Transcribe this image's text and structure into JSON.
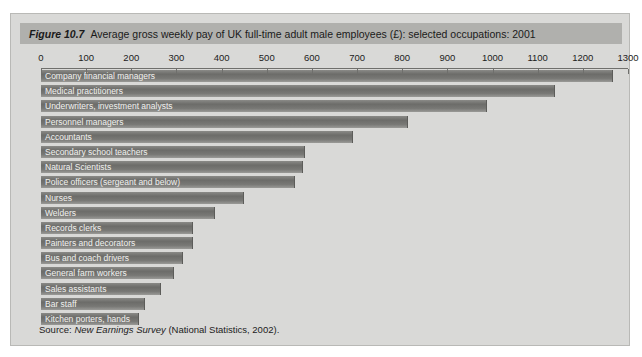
{
  "figure": {
    "number_label": "Figure 10.7",
    "title": "Average gross weekly pay of UK full-time adult male employees (£): selected occupations: 2001",
    "source_prefix": "Source:",
    "source_italic": "New Earnings Survey",
    "source_suffix": "(National Statistics, 2002).",
    "band_color": "#b0b0ad",
    "panel_color": "#d9d9d7",
    "bar_color": "#70706d"
  },
  "chart_data": {
    "type": "bar",
    "orientation": "horizontal",
    "title": "Average gross weekly pay of UK full-time adult male employees (£): selected occupations: 2001",
    "xlabel": "",
    "ylabel": "",
    "xlim": [
      0,
      1300
    ],
    "ticks": [
      0,
      100,
      200,
      300,
      400,
      500,
      600,
      700,
      800,
      900,
      1000,
      1100,
      1200,
      1300
    ],
    "grid": false,
    "legend": "none",
    "units": "£ per week",
    "categories": [
      "Company financial managers",
      "Medical practitioners",
      "Underwriters, investment analysts",
      "Personnel managers",
      "Accountants",
      "Secondary school teachers",
      "Natural Scientists",
      "Police officers (sergeant and below)",
      "Nurses",
      "Welders",
      "Records clerks",
      "Painters and decorators",
      "Bus and coach drivers",
      "General farm workers",
      "Sales assistants",
      "Bar staff",
      "Kitchen porters, hands"
    ],
    "values": [
      1264,
      1136,
      985,
      810,
      688,
      583,
      577,
      561,
      448,
      384,
      335,
      335,
      313,
      293,
      264,
      228,
      215
    ]
  }
}
